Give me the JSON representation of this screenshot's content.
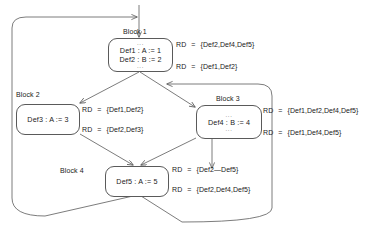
{
  "diagram": {
    "stroke_color": "#5a5a5a",
    "text_color": "#1a1a1a",
    "background": "#ffffff",
    "rd_keyword": "RD",
    "equals": "=",
    "ellipsis": "...",
    "blocks": [
      {
        "id": "block1",
        "title": "Block 1",
        "has_top_ellipsis": true,
        "has_bottom_ellipsis": true,
        "statements": [
          "Def1 : A := 1",
          "Def2 : B := 2"
        ],
        "rd_in": "{Def2,Def4,Def5}",
        "rd_out": "{Def1,Def2}"
      },
      {
        "id": "block2",
        "title": "Block 2",
        "has_top_ellipsis": false,
        "has_bottom_ellipsis": false,
        "statements": [
          "Def3 : A := 3"
        ],
        "rd_in": "{Def1,Def2}",
        "rd_out": "{Def2,Def3}"
      },
      {
        "id": "block3",
        "title": "Block 3",
        "has_top_ellipsis": true,
        "has_bottom_ellipsis": true,
        "statements": [
          "Def4 : B := 4"
        ],
        "rd_in": "{Def1,Def2,Def4,Def5}",
        "rd_out": "{Def1,Def4,Def5}"
      },
      {
        "id": "block4",
        "title": "Block 4",
        "has_top_ellipsis": false,
        "has_bottom_ellipsis": false,
        "statements": [
          "Def5 : A := 5"
        ],
        "rd_in": "{Def2—Def5}",
        "rd_out": "{Def2,Def4,Def5}"
      }
    ]
  }
}
